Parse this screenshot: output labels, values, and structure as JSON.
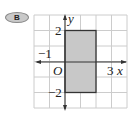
{
  "badge": {
    "label": "B"
  },
  "graph": {
    "x_range": [
      -2,
      4
    ],
    "y_range": [
      -3,
      3
    ],
    "axis_labels": {
      "x": "x",
      "y": "y"
    },
    "origin_label": "O",
    "tick_labels": {
      "x_pos": "3",
      "x_neg": "−1",
      "y_pos": "2",
      "y_neg": "−2"
    },
    "rectangle": {
      "x1": 0,
      "y1": -2,
      "x2": 2,
      "y2": 2,
      "fill": "#c8c8c8",
      "stroke": "#333333"
    },
    "grid_color": "#cccccc",
    "axis_color": "#333333"
  }
}
